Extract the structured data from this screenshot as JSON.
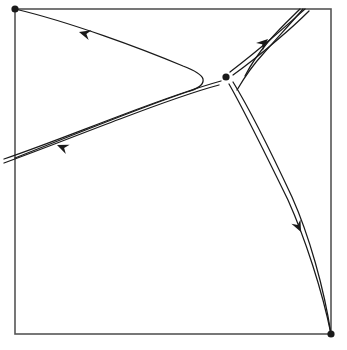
{
  "figure": {
    "kind": "phase-portrait",
    "title": "",
    "caption": "",
    "background_color": "#ffffff",
    "stroke_color": "#1a1a1a",
    "frame_color": "#555555",
    "frame_stroke_width": 1.6,
    "trajectory_stroke_width": 1.25
  },
  "frame": {
    "x": 15,
    "y": 9,
    "width": 316,
    "height": 325,
    "x2": 331,
    "y2": 334
  },
  "chart_data": {
    "type": "scatter",
    "title": "",
    "xlabel": "",
    "ylabel": "",
    "grid": false,
    "legend": false,
    "xlim": [
      15,
      331
    ],
    "ylim": [
      9,
      334
    ],
    "points": [
      {
        "name": "saddle-point",
        "x": 226,
        "y": 77,
        "radius": 3.6,
        "label": ""
      },
      {
        "name": "corner-node-top-left",
        "x": 15,
        "y": 9,
        "radius": 3.6,
        "label": ""
      },
      {
        "name": "corner-node-bottom-right",
        "x": 331,
        "y": 334,
        "radius": 3.6,
        "label": ""
      }
    ],
    "series": [
      {
        "name": "separatrix-upper-left-incoming",
        "direction": "toward-top-left",
        "path": "M15,9 C70,22 140,48 183,66 C196,71 202,75 203,79 C204,84 199,88 190,91"
      },
      {
        "name": "separatrix-upper-left-return",
        "direction": "toward-lower-left",
        "path": "M190,91 C150,104 80,132 15,158"
      },
      {
        "name": "separatrix-lower-left-outer",
        "direction": "toward-lower-left",
        "path": "M219,85 C200,90 170,100 120,119 C80,134 40,150 4,163"
      },
      {
        "name": "separatrix-lower-left-inner",
        "direction": "toward-lower-left",
        "path": "M221,81 C203,86 172,96 122,115 C82,130 42,146 4,159"
      },
      {
        "name": "separatrix-upper-right-outer",
        "direction": "toward-top-right",
        "path": "M230,72 C243,62 258,50 272,38 C285,27 296,17 305,9"
      },
      {
        "name": "separatrix-upper-right-inner",
        "direction": "toward-top-right",
        "path": "M233,75 C247,65 262,53 276,41 C289,30 300,20 309,11"
      },
      {
        "name": "separatrix-lower-right-outer",
        "direction": "toward-bottom-right",
        "path": "M229,84 C244,110 266,155 288,200 C305,238 322,290 331,334"
      },
      {
        "name": "separatrix-lower-right-inner",
        "direction": "toward-bottom-right",
        "path": "M233,82 C249,108 271,152 292,197 C309,235 324,288 331,334"
      },
      {
        "name": "separatrix-right-upper-branch-asymptote",
        "direction": "toward-top-right",
        "path": "M237,90 C244,78 252,66 263,54 C277,38 292,22 303,9"
      },
      {
        "name": "separatrix-right-lower-branch-asymptote",
        "direction": "toward-bottom",
        "path": "M245,76 C250,66 258,54 268,42 C281,27 293,16 300,9"
      }
    ],
    "arrows": [
      {
        "name": "arrow-upper-left",
        "x": 79,
        "y": 32,
        "angle": 196,
        "size": 11
      },
      {
        "name": "arrow-lower-left",
        "x": 57,
        "y": 145,
        "angle": 202,
        "size": 11
      },
      {
        "name": "arrow-upper-right",
        "x": 268,
        "y": 39,
        "angle": 318,
        "size": 11
      },
      {
        "name": "arrow-lower-right",
        "x": 301,
        "y": 232,
        "angle": 64,
        "size": 11
      }
    ]
  }
}
